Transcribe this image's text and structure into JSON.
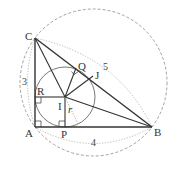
{
  "diagram": {
    "type": "geometry",
    "colors": {
      "stroke": "#333333",
      "dashed": "#888888",
      "dotted": "#999999"
    },
    "points": {
      "A": {
        "label": "A",
        "x": 35,
        "y": 127
      },
      "B": {
        "label": "B",
        "x": 152,
        "y": 127
      },
      "C": {
        "label": "C",
        "x": 35,
        "y": 38
      },
      "I": {
        "label": "I",
        "x": 65,
        "y": 97
      },
      "P": {
        "label": "P",
        "x": 65,
        "y": 127
      },
      "R": {
        "label": "R",
        "x": 35,
        "y": 97
      },
      "Q": {
        "label": "Q",
        "x": 76,
        "y": 68
      },
      "J": {
        "label": "J",
        "x": 93,
        "y": 76
      }
    },
    "labels": {
      "radius": "r",
      "side_AC": "3",
      "side_AB": "4",
      "side_BC": "5"
    },
    "incircle": {
      "cx": 65,
      "cy": 97,
      "r": 30
    },
    "circumcircle": {
      "cx": 93.5,
      "cy": 82.5,
      "r": 73.5
    }
  }
}
